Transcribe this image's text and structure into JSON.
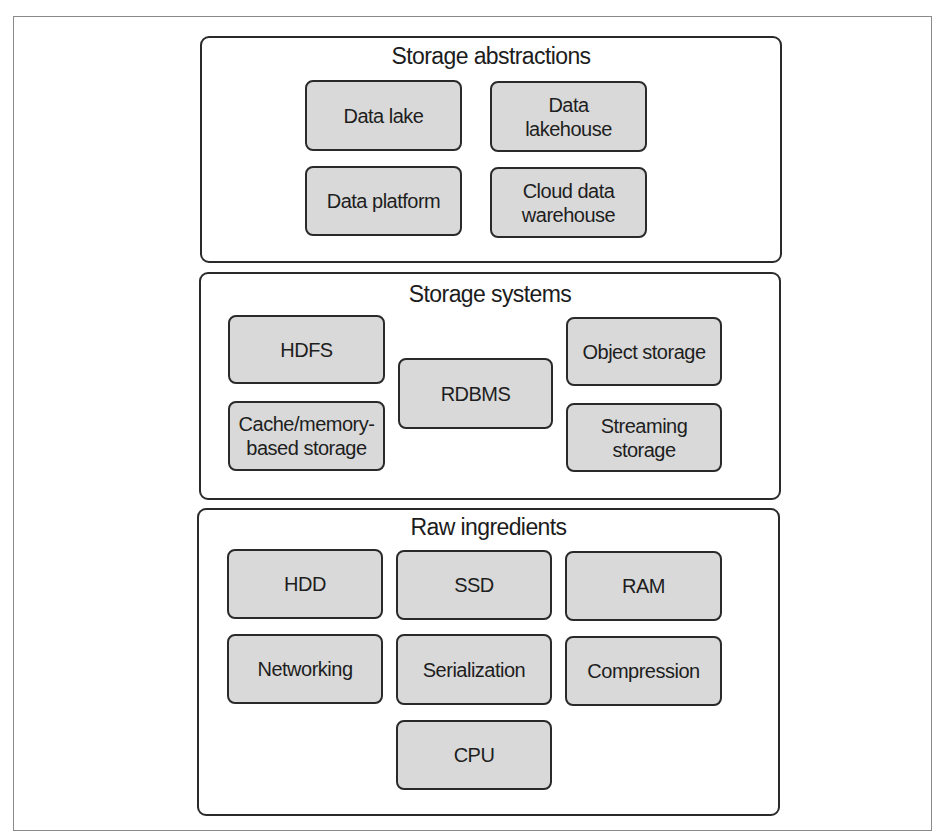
{
  "diagram": {
    "layers": [
      {
        "title": "Storage abstractions",
        "items": [
          "Data lake",
          "Data\nlakehouse",
          "Data platform",
          "Cloud data\nwarehouse"
        ]
      },
      {
        "title": "Storage systems",
        "items": [
          "HDFS",
          "Cache/memory-\nbased storage",
          "RDBMS",
          "Object storage",
          "Streaming\nstorage"
        ]
      },
      {
        "title": "Raw ingredients",
        "items": [
          "HDD",
          "SSD",
          "RAM",
          "Networking",
          "Serialization",
          "Compression",
          "CPU"
        ]
      }
    ],
    "colors": {
      "box_fill": "#d9d9d9",
      "border": "#2a2a2a",
      "background": "#ffffff"
    }
  }
}
